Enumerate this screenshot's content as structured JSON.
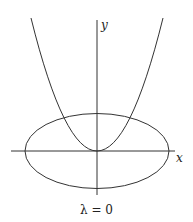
{
  "figure": {
    "axis_labels": {
      "x": "x",
      "y": "y"
    },
    "caption": "λ = 0",
    "curves": [
      {
        "name": "parabola",
        "description": "upward parabola with vertex at origin"
      },
      {
        "name": "ellipse",
        "description": "horizontal ellipse centered at origin"
      }
    ],
    "colors": {
      "stroke": "#333333",
      "background": "#ffffff"
    }
  }
}
